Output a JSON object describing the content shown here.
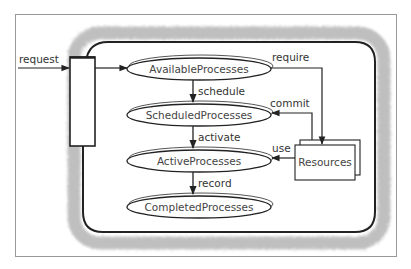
{
  "diagram": {
    "type": "process-flow",
    "nodes": {
      "available": "AvailableProcesses",
      "scheduled": "ScheduledProcesses",
      "active": "ActiveProcesses",
      "completed": "CompletedProcesses",
      "resources": "Resources"
    },
    "edges": {
      "request": "request",
      "schedule": "schedule",
      "activate": "activate",
      "record": "record",
      "require": "require",
      "commit": "commit",
      "use": "use"
    },
    "colors": {
      "line": "#222222",
      "frame": "#999999",
      "shadow": "#b5b5b5"
    }
  }
}
